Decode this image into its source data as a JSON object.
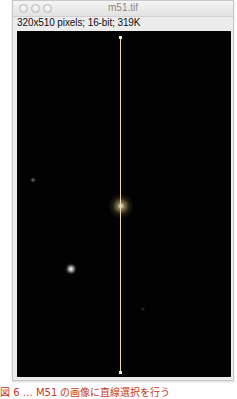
{
  "window": {
    "title": "m51.tif",
    "info_line": "320x510 pixels; 16-bit; 319K",
    "traffic_lights": [
      "close-button",
      "minimize-button",
      "zoom-button"
    ]
  },
  "image": {
    "background_color": "#020202",
    "line_selection": {
      "color": "#e9dcae",
      "orientation": "vertical"
    },
    "objects": [
      {
        "name": "galaxy-nucleus",
        "position": "center"
      },
      {
        "name": "bright-star",
        "position": "lower-left"
      },
      {
        "name": "faint-star",
        "position": "left"
      }
    ]
  },
  "caption": {
    "text": "図 6 … M51 の画像に直線選択を行う",
    "color": "#c0392b"
  }
}
